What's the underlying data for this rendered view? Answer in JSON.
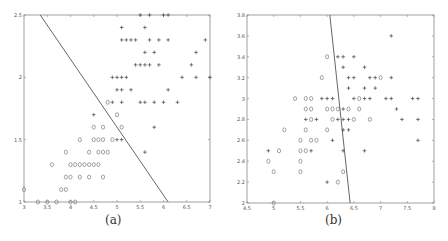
{
  "chart_data": [
    {
      "type": "scatter",
      "caption": "(a)",
      "xlim": [
        3,
        7
      ],
      "ylim": [
        1,
        2.5
      ],
      "xticks": [
        "3",
        "3.5",
        "4",
        "4.5",
        "5",
        "5.5",
        "6",
        "6.5",
        "7"
      ],
      "yticks": [
        "1",
        "1.5",
        "2",
        "2.5"
      ],
      "grid": false,
      "legend": null,
      "decision_line": [
        [
          3.35,
          2.5
        ],
        [
          6.1,
          1.0
        ]
      ],
      "series": [
        {
          "name": "class o",
          "marker": "o",
          "points": [
            [
              3.0,
              1.1
            ],
            [
              3.3,
              1.0
            ],
            [
              3.5,
              1.0
            ],
            [
              3.7,
              1.0
            ],
            [
              4.0,
              1.0
            ],
            [
              4.1,
              1.0
            ],
            [
              3.8,
              1.1
            ],
            [
              3.9,
              1.1
            ],
            [
              3.9,
              1.2
            ],
            [
              4.0,
              1.2
            ],
            [
              4.2,
              1.2
            ],
            [
              4.4,
              1.2
            ],
            [
              4.7,
              1.2
            ],
            [
              3.6,
              1.3
            ],
            [
              4.0,
              1.3
            ],
            [
              4.1,
              1.3
            ],
            [
              4.2,
              1.3
            ],
            [
              4.3,
              1.3
            ],
            [
              4.4,
              1.3
            ],
            [
              4.5,
              1.3
            ],
            [
              4.6,
              1.3
            ],
            [
              3.9,
              1.4
            ],
            [
              4.4,
              1.4
            ],
            [
              4.6,
              1.4
            ],
            [
              4.7,
              1.4
            ],
            [
              4.8,
              1.4
            ],
            [
              4.2,
              1.5
            ],
            [
              4.5,
              1.5
            ],
            [
              4.6,
              1.5
            ],
            [
              4.7,
              1.5
            ],
            [
              4.9,
              1.5
            ],
            [
              4.5,
              1.6
            ],
            [
              4.7,
              1.6
            ],
            [
              5.1,
              1.6
            ],
            [
              5.0,
              1.7
            ],
            [
              4.8,
              1.8
            ]
          ]
        },
        {
          "name": "class +",
          "marker": "+",
          "points": [
            [
              5.0,
              1.5
            ],
            [
              5.1,
              1.5
            ],
            [
              5.8,
              1.6
            ],
            [
              5.6,
              1.4
            ],
            [
              4.5,
              1.7
            ],
            [
              4.9,
              1.8
            ],
            [
              5.1,
              1.8
            ],
            [
              5.5,
              1.8
            ],
            [
              5.6,
              1.8
            ],
            [
              5.8,
              1.8
            ],
            [
              6.0,
              1.8
            ],
            [
              6.3,
              1.8
            ],
            [
              5.0,
              1.9
            ],
            [
              5.1,
              1.9
            ],
            [
              5.3,
              1.9
            ],
            [
              6.1,
              1.9
            ],
            [
              4.9,
              2.0
            ],
            [
              5.0,
              2.0
            ],
            [
              5.1,
              2.0
            ],
            [
              5.2,
              2.0
            ],
            [
              6.4,
              2.0
            ],
            [
              6.7,
              2.0
            ],
            [
              7.0,
              2.0
            ],
            [
              5.4,
              2.1
            ],
            [
              5.5,
              2.1
            ],
            [
              5.6,
              2.1
            ],
            [
              5.7,
              2.1
            ],
            [
              5.9,
              2.1
            ],
            [
              6.6,
              2.1
            ],
            [
              5.6,
              2.2
            ],
            [
              5.8,
              2.2
            ],
            [
              6.7,
              2.2
            ],
            [
              5.1,
              2.3
            ],
            [
              5.2,
              2.3
            ],
            [
              5.3,
              2.3
            ],
            [
              5.4,
              2.3
            ],
            [
              5.7,
              2.3
            ],
            [
              5.9,
              2.3
            ],
            [
              6.1,
              2.3
            ],
            [
              6.9,
              2.3
            ],
            [
              5.1,
              2.4
            ],
            [
              5.6,
              2.4
            ],
            [
              5.7,
              2.5
            ],
            [
              6.0,
              2.5
            ],
            [
              6.1,
              2.5
            ],
            [
              5.5,
              2.5
            ]
          ]
        }
      ]
    },
    {
      "type": "scatter",
      "caption": "(b)",
      "xlim": [
        4.5,
        8
      ],
      "ylim": [
        2,
        3.8
      ],
      "xticks": [
        "4.5",
        "5",
        "5.5",
        "6",
        "6.5",
        "7",
        "7.5",
        "8"
      ],
      "yticks": [
        "2",
        "2.2",
        "2.4",
        "2.6",
        "2.8",
        "3",
        "3.2",
        "3.4",
        "3.6",
        "3.8"
      ],
      "grid": false,
      "legend": null,
      "decision_line": [
        [
          6.05,
          3.8
        ],
        [
          6.43,
          2.0
        ]
      ],
      "series": [
        {
          "name": "class o",
          "marker": "o",
          "points": [
            [
              5.0,
              2.0
            ],
            [
              4.9,
              2.4
            ],
            [
              5.0,
              2.3
            ],
            [
              5.5,
              2.3
            ],
            [
              5.5,
              2.4
            ],
            [
              6.3,
              2.3
            ],
            [
              6.2,
              2.2
            ],
            [
              5.1,
              2.5
            ],
            [
              5.5,
              2.5
            ],
            [
              5.6,
              2.5
            ],
            [
              5.5,
              2.6
            ],
            [
              5.7,
              2.6
            ],
            [
              5.8,
              2.6
            ],
            [
              5.2,
              2.7
            ],
            [
              5.6,
              2.7
            ],
            [
              6.0,
              2.7
            ],
            [
              5.7,
              2.8
            ],
            [
              6.5,
              2.8
            ],
            [
              6.8,
              2.8
            ],
            [
              6.1,
              2.8
            ],
            [
              5.6,
              2.9
            ],
            [
              5.7,
              2.9
            ],
            [
              6.0,
              2.9
            ],
            [
              6.1,
              2.9
            ],
            [
              6.2,
              2.9
            ],
            [
              6.4,
              2.9
            ],
            [
              6.6,
              2.9
            ],
            [
              5.4,
              3.0
            ],
            [
              5.6,
              3.0
            ],
            [
              5.7,
              3.0
            ],
            [
              6.6,
              3.0
            ],
            [
              5.9,
              3.2
            ],
            [
              7.0,
              3.2
            ],
            [
              6.0,
              3.4
            ]
          ]
        },
        {
          "name": "class +",
          "marker": "+",
          "points": [
            [
              4.9,
              2.5
            ],
            [
              5.7,
              2.5
            ],
            [
              6.7,
              2.5
            ],
            [
              6.3,
              2.5
            ],
            [
              6.1,
              2.6
            ],
            [
              7.7,
              2.6
            ],
            [
              6.3,
              2.7
            ],
            [
              6.4,
              2.7
            ],
            [
              5.6,
              2.8
            ],
            [
              5.8,
              2.8
            ],
            [
              6.2,
              2.8
            ],
            [
              6.3,
              2.8
            ],
            [
              6.4,
              2.8
            ],
            [
              7.4,
              2.8
            ],
            [
              7.7,
              2.8
            ],
            [
              6.3,
              2.9
            ],
            [
              7.3,
              2.9
            ],
            [
              5.9,
              3.0
            ],
            [
              6.0,
              3.0
            ],
            [
              6.1,
              3.0
            ],
            [
              6.5,
              3.0
            ],
            [
              6.7,
              3.0
            ],
            [
              6.8,
              3.0
            ],
            [
              7.1,
              3.0
            ],
            [
              7.2,
              3.0
            ],
            [
              7.6,
              3.0
            ],
            [
              7.7,
              3.0
            ],
            [
              6.4,
              3.1
            ],
            [
              6.7,
              3.1
            ],
            [
              6.9,
              3.1
            ],
            [
              6.4,
              3.2
            ],
            [
              6.5,
              3.2
            ],
            [
              6.8,
              3.2
            ],
            [
              6.9,
              3.2
            ],
            [
              7.2,
              3.2
            ],
            [
              6.3,
              3.3
            ],
            [
              6.7,
              3.3
            ],
            [
              6.2,
              3.4
            ],
            [
              6.3,
              3.4
            ],
            [
              6.5,
              3.4
            ],
            [
              7.2,
              3.6
            ],
            [
              6.0,
              2.2
            ]
          ]
        }
      ]
    }
  ],
  "captions": {
    "a": "(a)",
    "b": "(b)"
  }
}
